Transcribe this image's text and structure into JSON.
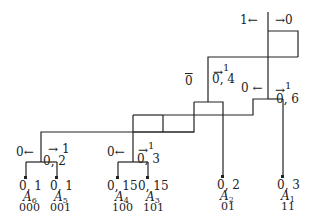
{
  "diagram": {
    "type": "huffman-coding-tree",
    "root": {
      "left_label": "1",
      "right_label": "0"
    },
    "internal_nodes": [
      {
        "id": "n04",
        "value": "0, 4",
        "left_label": "0",
        "right_label": "1"
      },
      {
        "id": "n06",
        "value": "0, 6",
        "left_label": "0",
        "right_label": "1"
      },
      {
        "id": "n02",
        "value": "0, 2",
        "left_label": "0",
        "right_label": "1"
      },
      {
        "id": "n03",
        "value": "0, 3",
        "left_label": "0",
        "right_label": "1"
      }
    ],
    "leaves": [
      {
        "prob": "0, 1",
        "symbol": "A",
        "sub": "6",
        "code": "000"
      },
      {
        "prob": "0, 1",
        "symbol": "A",
        "sub": "5",
        "code": "001"
      },
      {
        "prob": "0, 15",
        "symbol": "A",
        "sub": "4",
        "code": "100"
      },
      {
        "prob": "0, 15",
        "symbol": "A",
        "sub": "3",
        "code": "101"
      },
      {
        "prob": "0, 2",
        "symbol": "A",
        "sub": "2",
        "code": "01"
      },
      {
        "prob": "0, 3",
        "symbol": "A",
        "sub": "1",
        "code": "11"
      }
    ],
    "arrows": {
      "left": "←",
      "right": "→"
    }
  }
}
